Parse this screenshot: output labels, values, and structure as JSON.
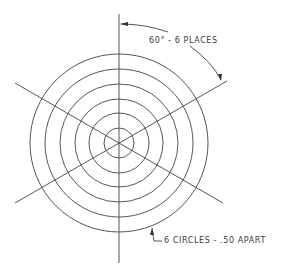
{
  "drawing": {
    "center": {
      "x": 119,
      "y": 143
    },
    "circle_count": 6,
    "circle_radii_px": [
      15,
      30,
      44,
      59,
      74,
      89
    ],
    "radial_line_angles_deg": [
      30,
      90,
      150,
      210,
      270,
      330
    ],
    "line_color": "#555555"
  },
  "annotations": {
    "angle_note": "60° - 6 PLACES",
    "circles_note": "6 CIRCLES - .50 APART"
  }
}
